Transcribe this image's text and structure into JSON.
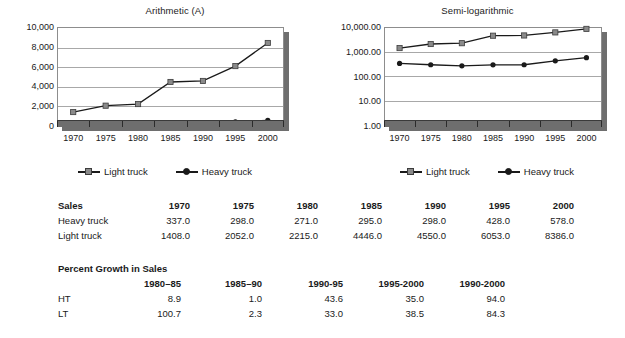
{
  "charts": [
    {
      "id": "arithmetic",
      "title": "Arithmetic (A)",
      "ylabels": [
        "10,000",
        "8,000",
        "6,000",
        "4,000",
        "2,000",
        "0"
      ],
      "xlabels": [
        "1970",
        "1975",
        "1980",
        "1985",
        "1990",
        "1995",
        "2000"
      ],
      "legend": [
        {
          "label": "Light truck",
          "marker": "square",
          "color": "#8a8a8a"
        },
        {
          "label": "Heavy truck",
          "marker": "circle",
          "color": "#1a1a1a"
        }
      ]
    },
    {
      "id": "semilog",
      "title": "Semi-logarithmic",
      "ylabels": [
        "10,000.00",
        "1,000.00",
        "100.00",
        "10.00",
        "1.00"
      ],
      "xlabels": [
        "1970",
        "1975",
        "1980",
        "1985",
        "1990",
        "1995",
        "2000"
      ],
      "legend": [
        {
          "label": "Light truck",
          "marker": "square",
          "color": "#8a8a8a"
        },
        {
          "label": "Heavy truck",
          "marker": "circle",
          "color": "#1a1a1a"
        }
      ]
    }
  ],
  "chart_data": [
    {
      "type": "line",
      "title": "Arithmetic (A)",
      "xlabel": "",
      "ylabel": "",
      "x": [
        1970,
        1975,
        1980,
        1985,
        1990,
        1995,
        2000
      ],
      "categories": [
        "1970",
        "1975",
        "1980",
        "1985",
        "1990",
        "1995",
        "2000"
      ],
      "ylim": [
        0,
        10000
      ],
      "yticks": [
        0,
        2000,
        4000,
        6000,
        8000,
        10000
      ],
      "ytick_labels": [
        "0",
        "2,000",
        "4,000",
        "6,000",
        "8,000",
        "10,000"
      ],
      "yscale": "linear",
      "grid": true,
      "legend_position": "bottom",
      "series": [
        {
          "name": "Light truck",
          "values": [
            1408.0,
            2052.0,
            2215.0,
            4446.0,
            4550.0,
            6053.0,
            8386.0
          ],
          "marker": "square",
          "color": "#8a8a8a"
        },
        {
          "name": "Heavy truck",
          "values": [
            337.0,
            298.0,
            271.0,
            295.0,
            298.0,
            428.0,
            578.0
          ],
          "marker": "circle",
          "color": "#1a1a1a"
        }
      ]
    },
    {
      "type": "line",
      "title": "Semi-logarithmic",
      "xlabel": "",
      "ylabel": "",
      "x": [
        1970,
        1975,
        1980,
        1985,
        1990,
        1995,
        2000
      ],
      "categories": [
        "1970",
        "1975",
        "1980",
        "1985",
        "1990",
        "1995",
        "2000"
      ],
      "ylim": [
        1,
        10000
      ],
      "yticks": [
        1,
        10,
        100,
        1000,
        10000
      ],
      "ytick_labels": [
        "1.00",
        "10.00",
        "100.00",
        "1,000.00",
        "10,000.00"
      ],
      "yscale": "log",
      "grid": true,
      "legend_position": "bottom",
      "series": [
        {
          "name": "Light truck",
          "values": [
            1408.0,
            2052.0,
            2215.0,
            4446.0,
            4550.0,
            6053.0,
            8386.0
          ],
          "marker": "square",
          "color": "#8a8a8a"
        },
        {
          "name": "Heavy truck",
          "values": [
            337.0,
            298.0,
            271.0,
            295.0,
            298.0,
            428.0,
            578.0
          ],
          "marker": "circle",
          "color": "#1a1a1a"
        }
      ]
    }
  ],
  "sales_table": {
    "headers": [
      "Sales",
      "1970",
      "1975",
      "1980",
      "1985",
      "1990",
      "1995",
      "2000"
    ],
    "rows": [
      {
        "label": "Heavy truck",
        "values": [
          "337.0",
          "298.0",
          "271.0",
          "295.0",
          "298.0",
          "428.0",
          "578.0"
        ]
      },
      {
        "label": "Light truck",
        "values": [
          "1408.0",
          "2052.0",
          "2215.0",
          "4446.0",
          "4550.0",
          "6053.0",
          "8386.0"
        ]
      }
    ]
  },
  "growth_table": {
    "caption": "Percent Growth in Sales",
    "headers": [
      "",
      "1980–85",
      "1985–90",
      "1990-95",
      "1995-2000",
      "1990-2000"
    ],
    "rows": [
      {
        "label": "HT",
        "values": [
          "8.9",
          "1.0",
          "43.6",
          "35.0",
          "94.0"
        ]
      },
      {
        "label": "LT",
        "values": [
          "100.7",
          "2.3",
          "33.0",
          "38.5",
          "84.3"
        ]
      }
    ]
  }
}
